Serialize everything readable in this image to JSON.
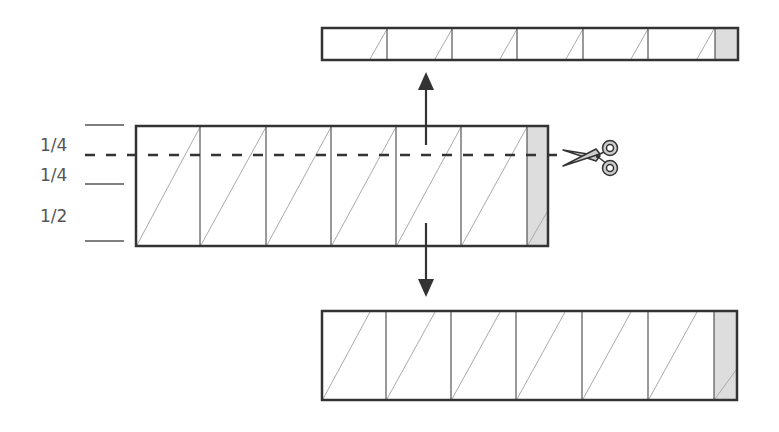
{
  "labels": {
    "top_quarter": "1/4",
    "middle_quarter": "1/4",
    "bottom_half": "1/2"
  },
  "colors": {
    "outline": "#333333",
    "divider": "#555555",
    "diagonal": "#aaaaaa",
    "shaded_cell": "#dddddd",
    "label": "#555555"
  },
  "icons": {
    "scissors": "scissors-icon",
    "arrow_up": "arrow-up-icon",
    "arrow_down": "arrow-down-icon"
  },
  "strips": {
    "main": {
      "x": 136,
      "y": 126,
      "w": 412,
      "h": 120,
      "dividers": [
        200,
        266,
        331,
        396,
        461,
        527
      ]
    },
    "top": {
      "x": 322,
      "y": 28,
      "w": 416,
      "h": 32,
      "dividers": [
        387,
        452,
        517,
        583,
        648,
        715
      ]
    },
    "bottom": {
      "x": 322,
      "y": 311,
      "w": 415,
      "h": 89,
      "dividers": [
        386,
        451,
        516,
        582,
        648,
        714
      ]
    }
  }
}
